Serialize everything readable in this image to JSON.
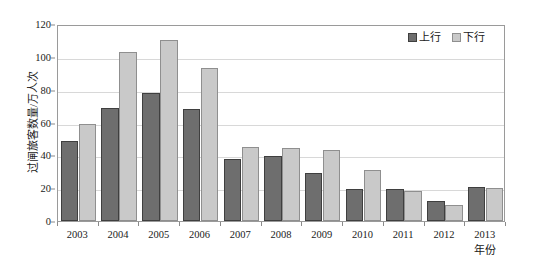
{
  "chart_data": {
    "type": "bar",
    "title": "",
    "subtitle": "",
    "xlabel": "年份",
    "ylabel": "过闸旅客数量/万人次",
    "categories": [
      "2003",
      "2004",
      "2005",
      "2006",
      "2007",
      "2008",
      "2009",
      "2010",
      "2011",
      "2012",
      "2013"
    ],
    "series": [
      {
        "name": "上行",
        "color": "#6e6e6e",
        "values": [
          49,
          69,
          78,
          68,
          37.5,
          39.5,
          29,
          19.5,
          19.5,
          12,
          21
        ]
      },
      {
        "name": "下行",
        "color": "#c9c9c9",
        "values": [
          59,
          103,
          110,
          93,
          45,
          44.5,
          43.5,
          31,
          18.5,
          10,
          20
        ]
      }
    ],
    "ylim": [
      0,
      120
    ],
    "yticks": [
      0,
      20,
      40,
      60,
      80,
      100,
      120
    ],
    "ytick_labels": [
      "0",
      "20",
      "40",
      "60",
      "80",
      "100",
      "120"
    ],
    "grid": true,
    "legend_position": "top-right",
    "legend_entries": [
      "上行",
      "下行"
    ]
  },
  "axes": {
    "y_title": "过闸旅客数量/万人次",
    "x_title": "年份"
  },
  "colors": {
    "series_up": "#6e6e6e",
    "series_down": "#c9c9c9",
    "grid": "#d8d8d8",
    "frame": "#9a9a9a",
    "text": "#1a1a1a"
  }
}
